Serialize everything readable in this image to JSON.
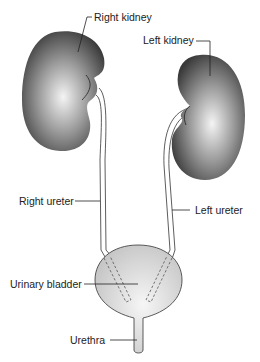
{
  "diagram": {
    "labels": {
      "right_kidney": "Right kidney",
      "left_kidney": "Left kidney",
      "right_ureter": "Right ureter",
      "left_ureter": "Left ureter",
      "urinary_bladder": "Urinary bladder",
      "urethra": "Urethra"
    },
    "colors": {
      "kidney_dark": "#3a3a3a",
      "kidney_light": "#f2f2f2",
      "bladder_light": "#f4f4f4",
      "bladder_dark": "#c8c8c8",
      "line": "#222222"
    }
  }
}
